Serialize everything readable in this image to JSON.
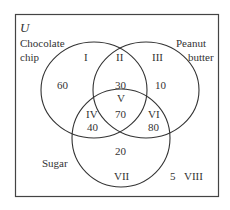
{
  "universe_label": "U",
  "sets": {
    "chocolate_chip": {
      "line1": "Chocolate",
      "line2": "chip"
    },
    "peanut_butter": {
      "line1": "Peanut",
      "line2": "butter"
    },
    "sugar": {
      "label": "Sugar"
    }
  },
  "regions": [
    {
      "id": "I",
      "numeral": "I",
      "value": "60"
    },
    {
      "id": "II",
      "numeral": "II",
      "value": "30"
    },
    {
      "id": "III",
      "numeral": "III",
      "value": "10"
    },
    {
      "id": "IV",
      "numeral": "IV",
      "value": "40"
    },
    {
      "id": "V",
      "numeral": "V",
      "value": "70"
    },
    {
      "id": "VI",
      "numeral": "VI",
      "value": "80"
    },
    {
      "id": "VII",
      "numeral": "VII",
      "value": "20"
    },
    {
      "id": "VIII",
      "numeral": "VIII",
      "value": "5"
    }
  ],
  "colors": {
    "stroke": "#333333",
    "background": "#ffffff"
  }
}
